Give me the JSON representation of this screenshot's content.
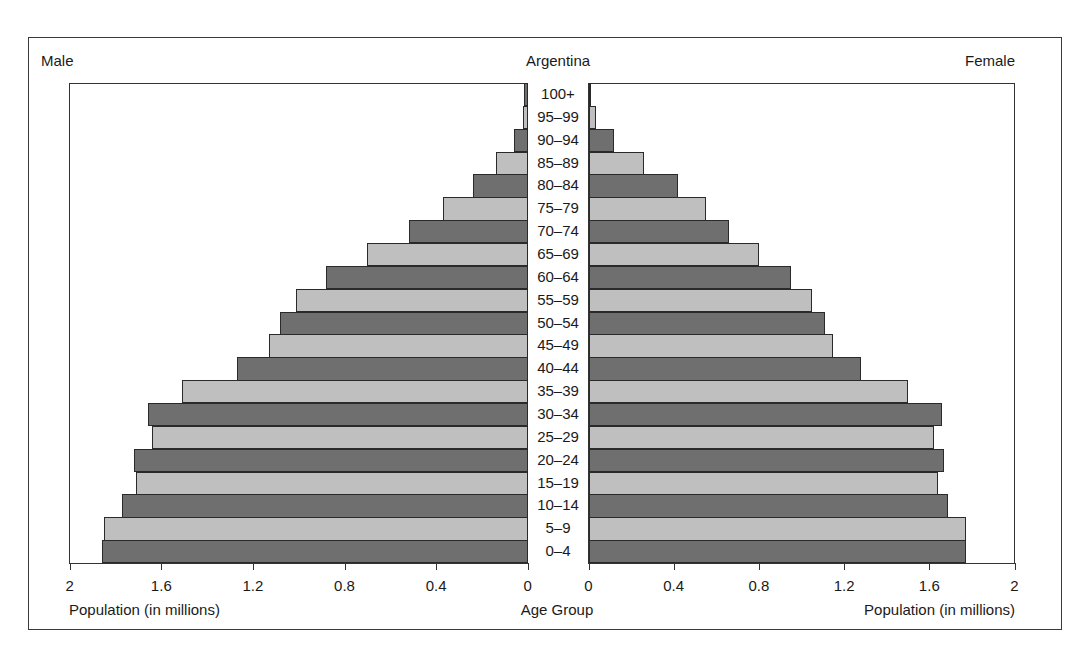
{
  "chart_data": {
    "type": "bar",
    "orientation": "horizontal",
    "subtype": "population-pyramid",
    "title": "Argentina",
    "left_label": "Male",
    "right_label": "Female",
    "xlabel_left": "Population (in millions)",
    "xlabel_right": "Population (in millions)",
    "center_label": "Age Group",
    "xlim": [
      0,
      2
    ],
    "x_ticks": [
      "0",
      "0.4",
      "0.8",
      "1.2",
      "1.6",
      "2"
    ],
    "grid": false,
    "categories": [
      "100+",
      "95–99",
      "90–94",
      "85–89",
      "80–84",
      "75–79",
      "70–74",
      "65–69",
      "60–64",
      "55–59",
      "50–54",
      "45–49",
      "40–44",
      "35–39",
      "30–34",
      "25–29",
      "20–24",
      "15–19",
      "10–14",
      "5–9",
      "0–4"
    ],
    "series": [
      {
        "name": "Male",
        "values": [
          0.015,
          0.022,
          0.06,
          0.14,
          0.24,
          0.37,
          0.52,
          0.7,
          0.88,
          1.01,
          1.08,
          1.13,
          1.27,
          1.51,
          1.66,
          1.64,
          1.72,
          1.71,
          1.77,
          1.85,
          1.86
        ]
      },
      {
        "name": "Female",
        "values": [
          0.01,
          0.034,
          0.12,
          0.26,
          0.42,
          0.55,
          0.66,
          0.8,
          0.95,
          1.05,
          1.11,
          1.15,
          1.28,
          1.5,
          1.66,
          1.62,
          1.67,
          1.64,
          1.69,
          1.77,
          1.77
        ]
      }
    ],
    "colors": {
      "dark": "#6f6f6f",
      "light": "#bfbfbf"
    }
  }
}
